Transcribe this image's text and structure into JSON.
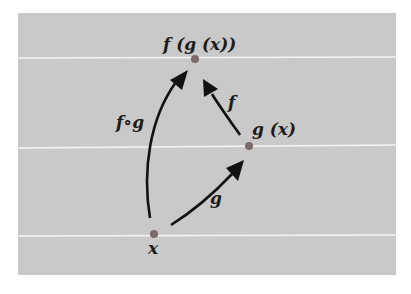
{
  "diagram": {
    "type": "function-composition",
    "colors": {
      "background": "#c9c9c9",
      "guide_line": "#f4f4f4",
      "point": "#7a6a6a",
      "arrow": "#111111",
      "text": "#1c1c1c"
    },
    "nodes": [
      {
        "id": "x",
        "label": "x",
        "x": 154,
        "y": 234
      },
      {
        "id": "gx",
        "label": "g (x)",
        "x": 249,
        "y": 146
      },
      {
        "id": "fgx",
        "label": "f (g (x))",
        "x": 195,
        "y": 59
      }
    ],
    "edges": [
      {
        "from": "x",
        "to": "gx",
        "label": "g"
      },
      {
        "from": "gx",
        "to": "fgx",
        "label": "f"
      },
      {
        "from": "x",
        "to": "fgx",
        "label": "f∘g"
      }
    ],
    "guide_lines_y": [
      58,
      147,
      236
    ]
  }
}
